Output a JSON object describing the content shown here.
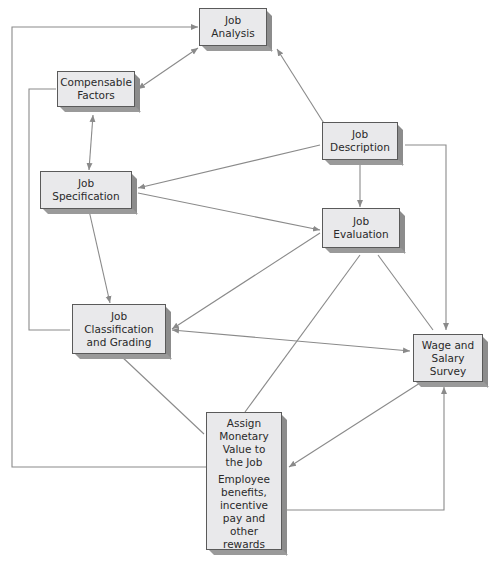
{
  "diagram": {
    "type": "flowchart",
    "colors": {
      "box_fill": "#e9e9eb",
      "box_border": "#5a5a5a",
      "shadow": "#8c8c8c",
      "line": "#8a8a8a"
    },
    "nodes": [
      {
        "id": "job_analysis",
        "label_lines": [
          "Job",
          "Analysis"
        ],
        "label": "Job Analysis"
      },
      {
        "id": "compensable_factors",
        "label_lines": [
          "Compensable",
          "Factors"
        ],
        "label": "Compensable Factors"
      },
      {
        "id": "job_description",
        "label_lines": [
          "Job",
          "Description"
        ],
        "label": "Job Description"
      },
      {
        "id": "job_specification",
        "label_lines": [
          "Job",
          "Specification"
        ],
        "label": "Job Specification"
      },
      {
        "id": "job_evaluation",
        "label_lines": [
          "Job",
          "Evaluation"
        ],
        "label": "Job Evaluation"
      },
      {
        "id": "job_classification",
        "label_lines": [
          "Job",
          "Classification",
          "and Grading"
        ],
        "label": "Job Classification and Grading"
      },
      {
        "id": "wage_survey",
        "label_lines": [
          "Wage and",
          "Salary",
          "Survey"
        ],
        "label": "Wage and Salary Survey"
      },
      {
        "id": "assign_value",
        "label_lines": [
          "Assign",
          "Monetary",
          "Value to",
          "the Job"
        ],
        "label": "Assign Monetary Value to the Job",
        "sub_label_lines": [
          "Employee",
          "benefits,",
          "incentive",
          "pay and",
          "other",
          "rewards"
        ],
        "sub_label": "Employee benefits, incentive pay and other rewards"
      }
    ],
    "edges": [
      {
        "from": "job_description",
        "to": "job_analysis",
        "arrow": "to"
      },
      {
        "from": "job_analysis",
        "to": "compensable_factors",
        "arrow": "both"
      },
      {
        "from": "compensable_factors",
        "to": "job_specification",
        "arrow": "both"
      },
      {
        "from": "job_description",
        "to": "job_specification",
        "arrow": "to"
      },
      {
        "from": "job_description",
        "to": "job_evaluation",
        "arrow": "to"
      },
      {
        "from": "job_description",
        "to": "wage_survey",
        "arrow": "to"
      },
      {
        "from": "job_specification",
        "to": "job_evaluation",
        "arrow": "to"
      },
      {
        "from": "job_specification",
        "to": "job_classification",
        "arrow": "to"
      },
      {
        "from": "job_evaluation",
        "to": "job_classification",
        "arrow": "to"
      },
      {
        "from": "job_evaluation",
        "to": "assign_value",
        "arrow": "none"
      },
      {
        "from": "job_evaluation",
        "to": "wage_survey",
        "arrow": "none"
      },
      {
        "from": "job_classification",
        "to": "wage_survey",
        "arrow": "both"
      },
      {
        "from": "job_classification",
        "to": "assign_value",
        "arrow": "none"
      },
      {
        "from": "wage_survey",
        "to": "assign_value",
        "arrow": "to"
      },
      {
        "from": "assign_value",
        "to": "wage_survey",
        "arrow": "to",
        "route": "bottom-right loop"
      },
      {
        "from": "assign_value",
        "to": "job_analysis",
        "arrow": "to",
        "route": "left outer loop"
      },
      {
        "from": "compensable_factors",
        "to": "job_classification",
        "arrow": "none",
        "route": "left inner loop"
      }
    ]
  }
}
